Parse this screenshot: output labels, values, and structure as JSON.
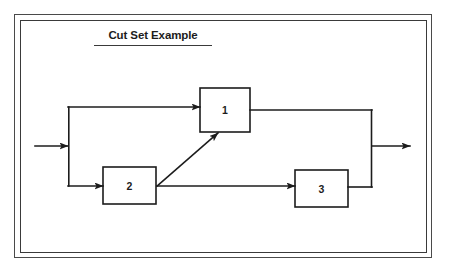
{
  "page": {
    "background_color": "#ffffff",
    "frame_color": "#3f3f3f",
    "ink_color": "#1c1c1c"
  },
  "figure": {
    "title": "Cut Set Example",
    "title_underlined": true
  },
  "diagram": {
    "type": "reliability-block-diagram",
    "blocks": [
      {
        "id": "block-1",
        "label": "1",
        "x": 200,
        "y": 88,
        "w": 50,
        "h": 44
      },
      {
        "id": "block-2",
        "label": "2",
        "x": 103,
        "y": 167,
        "w": 53,
        "h": 37
      },
      {
        "id": "block-3",
        "label": "3",
        "x": 295,
        "y": 170,
        "w": 53,
        "h": 37
      }
    ],
    "input_arrow": {
      "from_x": 35,
      "to_x": 68,
      "y": 146,
      "label": ""
    },
    "output_arrow": {
      "from_x": 372,
      "to_x": 410,
      "y": 146,
      "label": ""
    },
    "connections": [
      {
        "id": "input-to-split",
        "from": "input",
        "to": "split-node"
      },
      {
        "id": "split-to-block-1",
        "from": "split-node",
        "to": "block-1",
        "arrow": true
      },
      {
        "id": "split-to-block-2",
        "from": "split-node",
        "to": "block-2",
        "arrow": true
      },
      {
        "id": "block-1-to-merge",
        "from": "block-1",
        "to": "merge-node",
        "arrow": false
      },
      {
        "id": "block-2-to-block-1",
        "from": "block-2",
        "to": "block-1",
        "arrow": true,
        "style": "diagonal"
      },
      {
        "id": "block-2-to-block-3",
        "from": "block-2",
        "to": "block-3",
        "arrow": true
      },
      {
        "id": "block-3-to-merge",
        "from": "block-3",
        "to": "merge-node",
        "arrow": false
      },
      {
        "id": "merge-to-output",
        "from": "merge-node",
        "to": "output",
        "arrow": true
      }
    ]
  }
}
